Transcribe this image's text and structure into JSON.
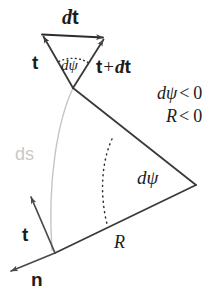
{
  "figure": {
    "background_color": "#ffffff",
    "line_color": "#3a3a3a",
    "curve_color": "#b8b8b8",
    "text_color": "#1c1c1c",
    "ds_color": "#c9c9c9"
  },
  "labels": {
    "dt_vector": {
      "italic_d": "d",
      "bold_t": "t",
      "full": "dt"
    },
    "t_left": "t",
    "dpsi_small": "dψ",
    "t_plus_dt": {
      "bold_t": "t",
      "plus": "+",
      "italic_d": "d",
      "bold_t2": "t",
      "full": "t + dt"
    },
    "dpsi_condition": {
      "symbol": "dψ",
      "op": "<",
      "value": "0",
      "full": "dψ < 0"
    },
    "R_condition": {
      "symbol": "R",
      "op": "<",
      "value": "0",
      "full": "R < 0"
    },
    "ds_arc": "ds",
    "dpsi_big": "dψ",
    "R_radius": "R",
    "t_bottom": "t",
    "n_normal": "n"
  },
  "geometry": {
    "small_triangle": {
      "apex": [
        73,
        88
      ],
      "top_left": [
        41,
        34
      ],
      "top_right": [
        106,
        37
      ],
      "arrowheads": [
        "top_left",
        "top_right"
      ]
    },
    "big_triangle": {
      "apex_right": [
        196,
        185
      ],
      "vertex_top": [
        73,
        88
      ],
      "vertex_bottom_left": [
        55,
        253
      ]
    },
    "arc_dpsi_small": {
      "radius": 30,
      "center": [
        73,
        88
      ]
    },
    "arc_dpsi_big": {
      "radius": 88,
      "center": [
        196,
        185
      ]
    },
    "ds_curve": {
      "from": [
        73,
        88
      ],
      "to": [
        52,
        250
      ]
    },
    "t_bottom_vector": {
      "from": [
        55,
        253
      ],
      "to": [
        30,
        195
      ]
    },
    "n_vector": {
      "from": [
        55,
        253
      ],
      "to": [
        9,
        272
      ]
    }
  }
}
